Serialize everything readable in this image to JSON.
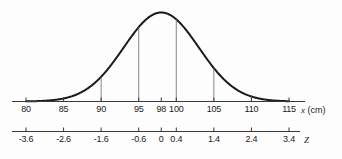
{
  "chart_data": {
    "type": "line",
    "title": "",
    "subtitle": "",
    "xlabel": "x (cm)",
    "ylabel": "",
    "secondary_xlabel": "Z",
    "grid": false,
    "legend": null,
    "annotations": [],
    "distribution": {
      "kind": "normal",
      "mean": 98,
      "std_dev": 5,
      "peak_x": 98
    },
    "x_axis": {
      "name": "x",
      "unit": "(cm)",
      "min": 80,
      "max": 115,
      "ticks": [
        80,
        85,
        90,
        95,
        98,
        100,
        105,
        110,
        115
      ],
      "tick_labels": [
        "80",
        "85",
        "90",
        "95",
        "98",
        "100",
        "105",
        "110",
        "115"
      ]
    },
    "z_axis": {
      "name": "Z",
      "min": -3.6,
      "max": 3.4,
      "ticks": [
        -3.6,
        -2.6,
        -1.6,
        -0.6,
        0,
        0.4,
        1.4,
        2.4,
        3.4
      ],
      "tick_labels": [
        "-3.6",
        "-2.6",
        "-1.6",
        "-0.6",
        "0",
        "0.4",
        "1.4",
        "2.4",
        "3.4"
      ]
    },
    "drop_lines_at_x": [
      85,
      90,
      95,
      100,
      105,
      110
    ],
    "curve_points_x": [
      80,
      81,
      82,
      83,
      84,
      85,
      86,
      87,
      88,
      89,
      90,
      91,
      92,
      93,
      94,
      95,
      96,
      97,
      98,
      99,
      100,
      101,
      102,
      103,
      104,
      105,
      106,
      107,
      108,
      109,
      110,
      111,
      112,
      113,
      114,
      115
    ],
    "curve_points_y": [
      0.0001,
      0.0003,
      0.0008,
      0.0018,
      0.0038,
      0.0074,
      0.0133,
      0.0222,
      0.0344,
      0.0495,
      0.0663,
      0.0825,
      0.0952,
      0.102,
      0.1016,
      0.094,
      0.0807,
      0.0644,
      0.0476,
      0.0327,
      0.0208,
      0.0123,
      0.0067,
      0.0034,
      0.0016,
      0.0007,
      0.0003,
      0.0001,
      4e-05,
      1e-05,
      5e-06,
      2e-06,
      1e-06,
      4e-07,
      1e-07,
      4e-08
    ]
  },
  "figure": {
    "colors": {
      "curve": "#1a1a1a",
      "axis": "#3a3a3a",
      "drop_line": "#6a6a6a",
      "text": "#1a1a1a",
      "background": "#fdfdfd"
    }
  }
}
